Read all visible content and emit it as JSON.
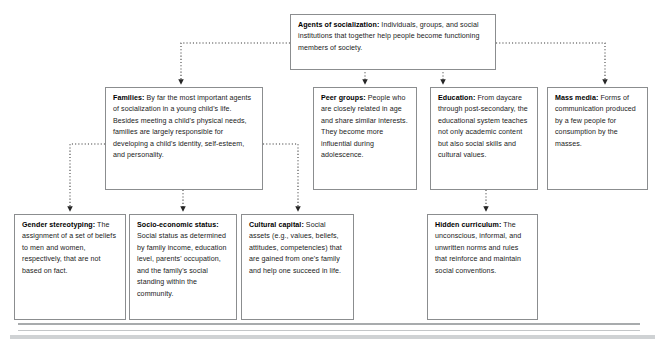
{
  "diagram": {
    "type": "flowchart",
    "colors": {
      "box_border": "#8b8d8f",
      "connector": "#3a3a3a",
      "text": "#1b1b1b",
      "rule": "#a8abad",
      "background": "#ffffff"
    },
    "nodes": [
      {
        "id": "agents",
        "level": 0,
        "term": "Agents of socialization:",
        "body": " Individuals, groups, and social institutions that together help people become functioning members of society."
      },
      {
        "id": "families",
        "level": 1,
        "term": "Families:",
        "body": " By far the most important agents of socialization in a young child's life. Besides meeting a child's physical needs, families are largely responsible for developing a child's identity, self-esteem, and personality."
      },
      {
        "id": "peer-groups",
        "level": 1,
        "term": "Peer groups:",
        "body": " People who are closely related in age and share similar interests. They become more influential during adolescence."
      },
      {
        "id": "education",
        "level": 1,
        "term": "Education:",
        "body": " From daycare through post-secondary, the educational system teaches not only academic content but also social skills and cultural values."
      },
      {
        "id": "mass-media",
        "level": 1,
        "term": "Mass media:",
        "body": " Forms of communication produced by a few people for consumption by the masses."
      },
      {
        "id": "gender-stereotyping",
        "level": 2,
        "term": "Gender stereotyping:",
        "body": " The assignment of a set of beliefs to men and women, respectively, that are not based on fact."
      },
      {
        "id": "socio-economic-status",
        "level": 2,
        "term": "Socio-economic status:",
        "body": " Social status as determined by family income, education level, parents' occupation, and the family's social standing within the community."
      },
      {
        "id": "cultural-capital",
        "level": 2,
        "term": "Cultural capital:",
        "body": " Social assets (e.g., values, beliefs, attitudes, competencies) that are gained from one's family and help one succeed in life."
      },
      {
        "id": "hidden-curriculum",
        "level": 2,
        "term": "Hidden curriculum:",
        "body": " The unconscious, informal, and unwritten norms and rules that reinforce and maintain social conventions."
      }
    ],
    "edges": [
      {
        "from": "agents",
        "to": "families",
        "style": "dotted-elbow-left"
      },
      {
        "from": "agents",
        "to": "peer-groups",
        "style": "dotted-straight"
      },
      {
        "from": "agents",
        "to": "education",
        "style": "dotted-straight"
      },
      {
        "from": "agents",
        "to": "mass-media",
        "style": "dotted-elbow-right"
      },
      {
        "from": "families",
        "to": "gender-stereotyping",
        "style": "dotted-elbow-left"
      },
      {
        "from": "families",
        "to": "socio-economic-status",
        "style": "dotted-straight"
      },
      {
        "from": "families",
        "to": "cultural-capital",
        "style": "dotted-elbow-right"
      },
      {
        "from": "education",
        "to": "hidden-curriculum",
        "style": "dotted-straight"
      }
    ]
  }
}
